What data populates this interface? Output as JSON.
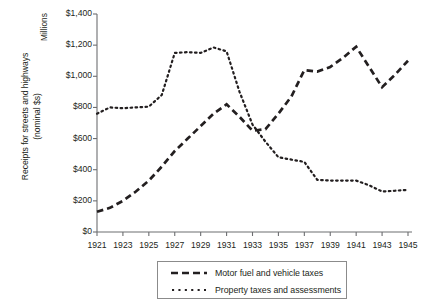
{
  "chart_data": {
    "type": "line",
    "title": "",
    "subtitle": "",
    "xlabel": "",
    "ylabel": "Receipts for streets and highways",
    "ylabel_line2": "(nominal $s)",
    "units_label": "Millions",
    "x": [
      1921,
      1922,
      1923,
      1924,
      1925,
      1926,
      1927,
      1928,
      1929,
      1930,
      1931,
      1932,
      1933,
      1934,
      1935,
      1936,
      1937,
      1938,
      1939,
      1940,
      1941,
      1942,
      1943,
      1944,
      1945
    ],
    "xtick_labels": [
      "1921",
      "1923",
      "1925",
      "1927",
      "1929",
      "1931",
      "1933",
      "1935",
      "1937",
      "1939",
      "1941",
      "1943",
      "1945"
    ],
    "xtick_values": [
      1921,
      1923,
      1925,
      1927,
      1929,
      1931,
      1933,
      1935,
      1937,
      1939,
      1941,
      1943,
      1945
    ],
    "xlim": [
      1921,
      1945
    ],
    "ytick_labels": [
      "$0",
      "$200",
      "$400",
      "$600",
      "$800",
      "$1,000",
      "$1,200",
      "$1,400"
    ],
    "ytick_values": [
      0,
      200,
      400,
      600,
      800,
      1000,
      1200,
      1400
    ],
    "ylim": [
      0,
      1400
    ],
    "grid": false,
    "legend_position": "bottom",
    "series": [
      {
        "name": "Motor fuel and vehicle taxes",
        "style": "dashed",
        "color": "#231f20",
        "values": [
          130,
          155,
          200,
          260,
          330,
          420,
          520,
          600,
          680,
          760,
          820,
          740,
          650,
          660,
          760,
          870,
          1040,
          1030,
          1060,
          1120,
          1190,
          1060,
          930,
          1010,
          1100
        ]
      },
      {
        "name": "Property taxes and assessments",
        "style": "dotted",
        "color": "#231f20",
        "values": [
          760,
          800,
          795,
          800,
          805,
          880,
          1150,
          1155,
          1150,
          1185,
          1160,
          900,
          690,
          580,
          480,
          465,
          450,
          335,
          330,
          330,
          330,
          300,
          260,
          265,
          270
        ]
      }
    ]
  },
  "legend": {
    "items": [
      {
        "label": "Motor fuel and vehicle taxes",
        "style": "dashed"
      },
      {
        "label": "Property taxes and assessments",
        "style": "dotted"
      }
    ]
  }
}
